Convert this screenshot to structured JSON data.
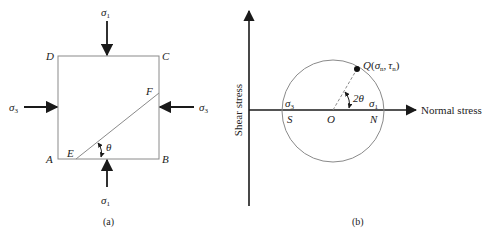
{
  "figure_a": {
    "caption": "(a)",
    "corners": {
      "A": "A",
      "B": "B",
      "C": "C",
      "D": "D"
    },
    "plane_points": {
      "E": "E",
      "F": "F"
    },
    "angle_label": "θ",
    "stress_top": {
      "sym": "σ",
      "sub": "1"
    },
    "stress_bottom": {
      "sym": "σ",
      "sub": "1"
    },
    "stress_left": {
      "sym": "σ",
      "sub": "3"
    },
    "stress_right": {
      "sym": "σ",
      "sub": "3"
    }
  },
  "figure_b": {
    "caption": "(b)",
    "x_axis_label": "Normal stress",
    "y_axis_label": "Shear stress",
    "points": {
      "S": "S",
      "O": "O",
      "N": "N"
    },
    "sigma3": {
      "sym": "σ",
      "sub": "3"
    },
    "sigma1": {
      "sym": "σ",
      "sub": "1"
    },
    "angle_label": "2θ",
    "q_point": {
      "name": "Q",
      "open": "(",
      "sigma": "σ",
      "sigma_sub": "n",
      "comma": ",",
      "tau": "τ",
      "tau_sub": "n",
      "close": ")"
    }
  },
  "colors": {
    "line": "#8a8a8a",
    "arrow": "#1a1a1a",
    "text": "#222222"
  }
}
